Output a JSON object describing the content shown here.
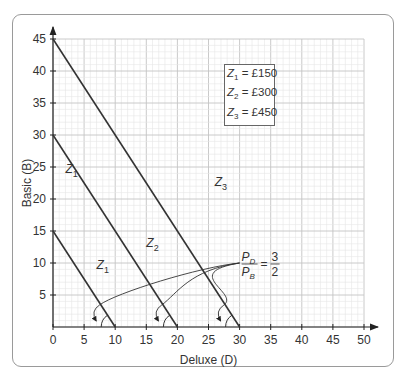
{
  "chart_data": {
    "type": "line",
    "title": "",
    "xlabel": "Deluxe (D)",
    "ylabel": "Basic (B)",
    "xlim": [
      0,
      50
    ],
    "ylim": [
      0,
      45
    ],
    "x_ticks": [
      "0",
      "5",
      "10",
      "15",
      "20",
      "25",
      "30",
      "35",
      "40",
      "45",
      "50"
    ],
    "y_ticks": [
      "5",
      "10",
      "15",
      "20",
      "25",
      "30",
      "35",
      "40",
      "45"
    ],
    "grid": true,
    "series": [
      {
        "name": "Z1",
        "points": [
          [
            0,
            15
          ],
          [
            10,
            0
          ]
        ]
      },
      {
        "name": "Z2",
        "points": [
          [
            0,
            30
          ],
          [
            20,
            0
          ]
        ]
      },
      {
        "name": "Z3",
        "points": [
          [
            0,
            45
          ],
          [
            30,
            0
          ]
        ]
      }
    ],
    "legend": [
      {
        "name": "Z",
        "sub": "1",
        "value": "= £150"
      },
      {
        "name": "Z",
        "sub": "2",
        "value": "= £300"
      },
      {
        "name": "Z",
        "sub": "3",
        "value": "= £450"
      }
    ],
    "line_labels": [
      {
        "name": "Z",
        "sub": "1",
        "at": [
          7,
          9
        ]
      },
      {
        "name": "Z",
        "sub": "1",
        "at": [
          2,
          24
        ]
      },
      {
        "name": "Z",
        "sub": "2",
        "at": [
          15,
          12.5
        ]
      },
      {
        "name": "Z",
        "sub": "3",
        "at": [
          26,
          22
        ]
      }
    ],
    "annotation": {
      "text": "P_D / P_B = 3/2",
      "num_left": "P",
      "num_left_sub": "D",
      "den_left": "P",
      "den_left_sub": "B",
      "num_right": "3",
      "den_right": "2",
      "eq": "=",
      "at": [
        30,
        10
      ]
    }
  }
}
